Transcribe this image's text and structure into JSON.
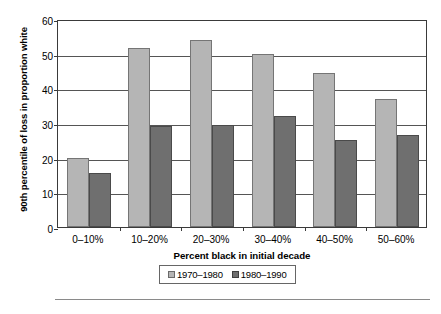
{
  "chart_data": {
    "type": "bar",
    "title": "",
    "xlabel": "Percent black in initial decade",
    "ylabel": "90th percentile of loss in proportion white",
    "categories": [
      "0–10%",
      "10–20%",
      "20–30%",
      "30–40%",
      "40–50%",
      "50–60%"
    ],
    "series": [
      {
        "name": "1970–1980",
        "color": "#b5b5b5",
        "values": [
          20,
          51.5,
          54,
          50,
          44.5,
          37
        ]
      },
      {
        "name": "1980–1990",
        "color": "#6f6f6f",
        "values": [
          15.5,
          29,
          29.5,
          32,
          25,
          26.5
        ]
      }
    ],
    "ylim": [
      0,
      60
    ],
    "yticks": [
      0,
      10,
      20,
      30,
      40,
      50,
      60
    ],
    "ytick_labels": [
      "0",
      "10",
      "20",
      "30",
      "40",
      "50",
      "60"
    ],
    "grid": true,
    "grid_axis": "y",
    "legend_position": "bottom-center"
  },
  "legend": {
    "items": [
      {
        "label": "1970–1980"
      },
      {
        "label": "1980–1990"
      }
    ]
  }
}
